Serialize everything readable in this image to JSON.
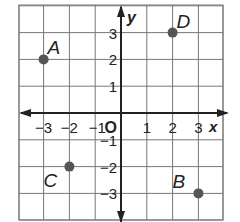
{
  "axes": {
    "x_label": "x",
    "y_label": "y",
    "origin_label": "O",
    "x_ticks": [
      {
        "value": -3,
        "label": "−3"
      },
      {
        "value": -2,
        "label": "−2"
      },
      {
        "value": -1,
        "label": "−1"
      },
      {
        "value": 1,
        "label": "1"
      },
      {
        "value": 2,
        "label": "2"
      },
      {
        "value": 3,
        "label": "3"
      }
    ],
    "y_ticks": [
      {
        "value": 3,
        "label": "3"
      },
      {
        "value": 2,
        "label": "2"
      },
      {
        "value": 1,
        "label": "1"
      },
      {
        "value": -1,
        "label": "−1"
      },
      {
        "value": -2,
        "label": "−2"
      },
      {
        "value": -3,
        "label": "−3"
      }
    ]
  },
  "points": [
    {
      "name": "A",
      "x": -3,
      "y": 2
    },
    {
      "name": "B",
      "x": 3,
      "y": -3
    },
    {
      "name": "C",
      "x": -2,
      "y": -2
    },
    {
      "name": "D",
      "x": 2,
      "y": 3
    }
  ],
  "colors": {
    "grid": "#777777",
    "axis": "#222222",
    "point": "#555555"
  }
}
